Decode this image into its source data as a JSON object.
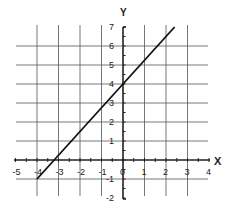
{
  "chart_data": {
    "type": "line",
    "title": "",
    "xlabel": "X",
    "ylabel": "Y",
    "xlim": [
      -5,
      4
    ],
    "ylim": [
      -2,
      7
    ],
    "grid": true,
    "x_ticks": [
      -5,
      -4,
      -3,
      -2,
      -1,
      0,
      1,
      2,
      3,
      4
    ],
    "y_ticks": [
      -2,
      -1,
      0,
      1,
      2,
      3,
      4,
      5,
      6,
      7
    ],
    "series": [
      {
        "name": "line",
        "equation": "y = 1.25x + 4",
        "x": [
          -4,
          2.4
        ],
        "y": [
          -1,
          7
        ]
      }
    ]
  }
}
